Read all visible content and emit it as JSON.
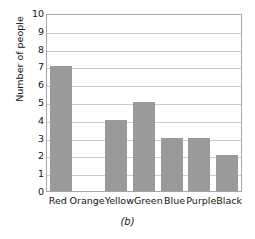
{
  "chart_data": {
    "type": "bar",
    "title": "",
    "caption": "(b)",
    "xlabel": "",
    "ylabel": "Number of people",
    "categories": [
      "Red",
      "Orange",
      "Yellow",
      "Green",
      "Blue",
      "Purple",
      "Black"
    ],
    "values": [
      7,
      0,
      4,
      5,
      3,
      3,
      2
    ],
    "ylim": [
      0,
      10
    ],
    "yticks": [
      10,
      9,
      8,
      7,
      6,
      5,
      4,
      3,
      2,
      1,
      0
    ],
    "grid": "horizontal",
    "legend": "none",
    "bar_color": "#9a9a9a",
    "grid_color": "#cccccc",
    "frame_color": "#a6a6a6",
    "background_color": "#ffffff"
  }
}
